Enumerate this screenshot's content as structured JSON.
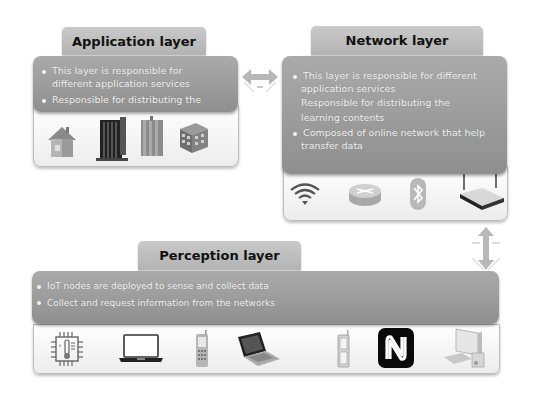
{
  "application_layer": {
    "title": "Application layer",
    "bullets": [
      {
        "text": "This layer is responsible for",
        "bullet": true
      },
      {
        "text": "different application services",
        "bullet": false
      },
      {
        "text": "Responsible for distributing the",
        "bullet": true
      }
    ],
    "icons": [
      "house-icon",
      "building-tower-icon",
      "columns-building-icon",
      "office-block-icon"
    ]
  },
  "network_layer": {
    "title": "Network layer",
    "bullets": [
      {
        "text": "This layer is responsible for different",
        "bullet": true
      },
      {
        "text": "application services",
        "bullet": false
      },
      {
        "text": "Responsible for distributing the",
        "bullet": false
      },
      {
        "text": "learning contents",
        "bullet": false
      },
      {
        "text": "Composed of online network that help",
        "bullet": true
      },
      {
        "text": "transfer data",
        "bullet": false
      }
    ],
    "icons": [
      "wifi-icon",
      "router-icon",
      "bluetooth-icon",
      "wireless-router-icon"
    ]
  },
  "perception_layer": {
    "title": "Perception layer",
    "bullets": [
      {
        "text": "IoT nodes are deployed to sense and collect data",
        "bullet": true
      },
      {
        "text": "Collect and request information  from the networks",
        "bullet": true
      }
    ],
    "icons": [
      "temperature-sensor-chip-icon",
      "laptop-icon",
      "mobile-phone-icon",
      "notebook-icon",
      "flip-phone-icon",
      "nfc-icon",
      "desktop-computer-icon"
    ]
  },
  "connectors": {
    "horizontal": "bidirectional-arrow-app-network",
    "vertical": "bidirectional-arrow-network-perception"
  },
  "colors": {
    "panel": "#9e9e9e",
    "tab": "#bdbdbd",
    "tray": "#f4f4f4",
    "text_light": "#f2f2f2"
  }
}
